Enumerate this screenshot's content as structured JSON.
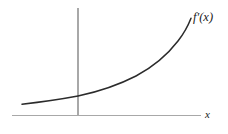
{
  "figure": {
    "background_color": "#ffffff",
    "width": 228,
    "height": 134,
    "curve_label": "f′(x)",
    "xaxis_label": "x",
    "yaxis_label": "",
    "axis_color": "#a8a8a8",
    "curve_color": "#2b2b2b"
  },
  "chart_data": {
    "type": "line",
    "title": "",
    "subtitle": "",
    "xlabel": "x",
    "ylabel": "",
    "grid": false,
    "legend": null,
    "annotations": [
      {
        "text": "f′(x)",
        "x": 4.6,
        "y": 5.0,
        "role": "curve-label",
        "position": "upper-right-end-of-curve"
      },
      {
        "text": "x",
        "x": 5.5,
        "y": -0.25,
        "role": "axis-label",
        "position": "right-end-of-x-axis"
      }
    ],
    "axes": {
      "x_axis_drawn": true,
      "y_axis_drawn": true,
      "x_axis_range": [
        -2.2,
        5.1
      ],
      "y_axis_range": [
        0,
        5.4
      ],
      "origin_pixel": [
        78,
        115
      ],
      "x_ticks": [],
      "y_ticks": [],
      "x_tick_labels": [],
      "y_tick_labels": []
    },
    "series": [
      {
        "name": "f'(x)",
        "description": "increasing convex exponential-like curve, positive and concave up throughout",
        "color": "#2b2b2b",
        "x": [
          -1.75,
          -1.4,
          -1.05,
          -0.7,
          -0.35,
          0.0,
          0.35,
          0.7,
          1.05,
          1.4,
          1.75,
          2.1,
          2.45,
          2.8,
          3.15,
          3.5,
          3.85,
          4.2
        ],
        "y": [
          0.42,
          0.5,
          0.6,
          0.7,
          0.82,
          0.95,
          1.12,
          1.3,
          1.52,
          1.78,
          2.08,
          2.42,
          2.82,
          3.28,
          3.8,
          4.4,
          5.05,
          5.35
        ]
      }
    ]
  }
}
